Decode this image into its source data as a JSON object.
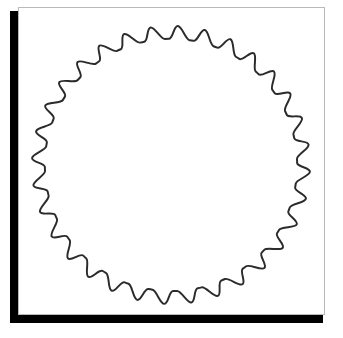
{
  "canvas": {
    "width": 343,
    "height": 338,
    "background_color": "#ffffff"
  },
  "card": {
    "background_color": "#ffffff",
    "border_color": "#b9b9b9",
    "border_width": 1,
    "x": 18,
    "y": 7,
    "width": 307,
    "height": 308
  },
  "shadow": {
    "color": "#000000",
    "x": 10,
    "y": 11,
    "width": 313,
    "height": 312
  },
  "figure": {
    "caption": "",
    "label": "gear-outline",
    "stroke_color": "#2b2b2b",
    "stroke_width": 2,
    "fill": "none"
  },
  "chart_data": {
    "type": "line",
    "title": "",
    "subtitle": "",
    "xlabel": "",
    "ylabel": "",
    "legend": [],
    "annotations": [],
    "shape": "gear",
    "teeth": 32,
    "center_x": 153,
    "center_y": 158,
    "outer_radius": 140,
    "root_radius": 127,
    "tooth_fraction": 0.5,
    "corner_smoothing": 0.34,
    "start_angle_deg": -90,
    "grid": false,
    "xlim": [
      0,
      307
    ],
    "ylim": [
      0,
      308
    ]
  }
}
